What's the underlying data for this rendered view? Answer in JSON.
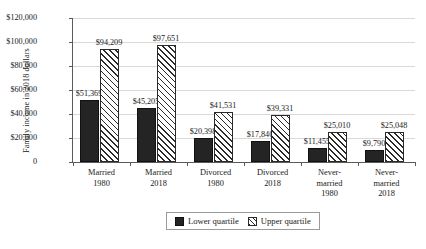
{
  "chart_data": {
    "type": "bar",
    "title": "",
    "xlabel": "",
    "ylabel": "Family income in 2018 dollars",
    "ylim": [
      0,
      120000
    ],
    "grid": true,
    "legend_position": "bottom",
    "categories": [
      {
        "line1": "Married",
        "line2": "1980",
        "line3": ""
      },
      {
        "line1": "Married",
        "line2": "2018",
        "line3": ""
      },
      {
        "line1": "Divorced",
        "line2": "1980",
        "line3": ""
      },
      {
        "line1": "Divorced",
        "line2": "2018",
        "line3": ""
      },
      {
        "line1": "Never-",
        "line2": "married",
        "line3": "1980"
      },
      {
        "line1": "Never-",
        "line2": "married",
        "line3": "2018"
      }
    ],
    "ytick_labels": [
      "$120,000",
      "$100,000",
      "$80,000",
      "$60,000",
      "$40,000",
      "$20,000",
      "0"
    ],
    "ytick_values": [
      120000,
      100000,
      80000,
      60000,
      40000,
      20000,
      0
    ],
    "series": [
      {
        "name": "Lower quartile",
        "color": "#242424",
        "pattern": "solid",
        "values": [
          51369,
          45205,
          20398,
          17840,
          11455,
          9790
        ],
        "labels": [
          "$51,369",
          "$45,205",
          "$20,398",
          "$17,840",
          "$11,455",
          "$9,790"
        ]
      },
      {
        "name": "Upper quartile",
        "color": "#ffffff",
        "pattern": "diagonal-hatch",
        "values": [
          94209,
          97651,
          41531,
          39331,
          25010,
          25048
        ],
        "labels": [
          "$94,209",
          "$97,651",
          "$41,531",
          "$39,331",
          "$25,010",
          "$25,048"
        ]
      }
    ]
  }
}
